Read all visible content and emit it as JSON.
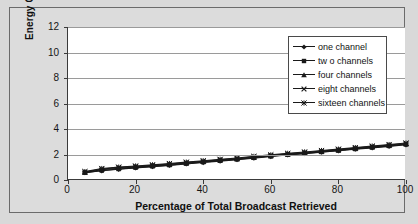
{
  "chart_data": {
    "type": "line",
    "title": "",
    "subtitle": "",
    "xlabel": "Percentage of Total Broadcast Retrieved",
    "ylabel": "Energy Consumption (Joules)",
    "xlim": [
      0,
      100
    ],
    "ylim": [
      0,
      12
    ],
    "xticks": [
      0,
      20,
      40,
      60,
      80,
      100
    ],
    "yticks": [
      0,
      2,
      4,
      6,
      8,
      10,
      12
    ],
    "grid": "horizontal",
    "legend_position": "upper-right",
    "x": [
      5,
      10,
      15,
      20,
      25,
      30,
      35,
      40,
      45,
      50,
      55,
      60,
      65,
      70,
      75,
      80,
      85,
      90,
      95,
      100
    ],
    "series": [
      {
        "name": "one channel",
        "marker": "diamond",
        "color": "#1a1a1a",
        "values": [
          0.58,
          0.72,
          0.84,
          0.95,
          1.05,
          1.14,
          1.26,
          1.37,
          1.48,
          1.6,
          1.71,
          1.84,
          1.96,
          2.07,
          2.18,
          2.29,
          2.41,
          2.52,
          2.64,
          2.76
        ]
      },
      {
        "name": "two channels",
        "marker": "square",
        "color": "#1a1a1a",
        "values": [
          0.57,
          0.74,
          0.86,
          0.97,
          1.07,
          1.17,
          1.29,
          1.4,
          1.51,
          1.62,
          1.74,
          1.86,
          1.98,
          2.09,
          2.2,
          2.31,
          2.43,
          2.55,
          2.67,
          2.79
        ]
      },
      {
        "name": "four channels",
        "marker": "triangle",
        "color": "#1a1a1a",
        "values": [
          0.6,
          0.8,
          0.92,
          1.02,
          1.11,
          1.21,
          1.32,
          1.43,
          1.54,
          1.65,
          1.77,
          1.89,
          2.01,
          2.12,
          2.23,
          2.34,
          2.46,
          2.58,
          2.7,
          2.82
        ]
      },
      {
        "name": "eight channels",
        "marker": "x",
        "color": "#1a1a1a",
        "values": [
          0.63,
          0.86,
          0.97,
          1.06,
          1.15,
          1.25,
          1.36,
          1.47,
          1.58,
          1.69,
          1.81,
          1.93,
          2.05,
          2.16,
          2.27,
          2.38,
          2.5,
          2.62,
          2.74,
          2.86
        ]
      },
      {
        "name": "sixteen channels",
        "marker": "asterisk",
        "color": "#1a1a1a",
        "values": [
          0.66,
          0.9,
          1.01,
          1.1,
          1.19,
          1.29,
          1.4,
          1.51,
          1.62,
          1.73,
          1.85,
          1.97,
          2.09,
          2.2,
          2.31,
          2.42,
          2.54,
          2.66,
          2.78,
          2.9
        ]
      }
    ]
  },
  "legend": {
    "entries": [
      {
        "label": "one channel",
        "marker": "diamond"
      },
      {
        "label": "tw o channels",
        "marker": "square"
      },
      {
        "label": "four channels",
        "marker": "triangle"
      },
      {
        "label": "eight channels",
        "marker": "x"
      },
      {
        "label": "sixteen channels",
        "marker": "asterisk"
      }
    ]
  },
  "colors": {
    "figure_background": "#d9d9d9",
    "plot_background": "#ffffff",
    "axis": "#3a3a3a",
    "gridline": "#9a9a9a",
    "series": "#1a1a1a",
    "frame_border": "#6b6b6b"
  }
}
